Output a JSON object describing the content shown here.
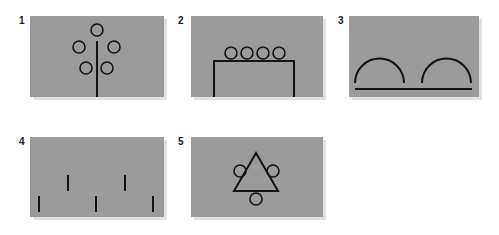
{
  "figure": {
    "background_color": "#ffffff",
    "panel_color": "#9b9b9b",
    "line_color": "#141414",
    "panels": [
      {
        "id": 1,
        "label": "1",
        "description": "Vertical stem with five circles arranged around its top (tree-like pattern)"
      },
      {
        "id": 2,
        "label": "2",
        "description": "Four circles in a row resting on top of a rectangular bracket/table shape"
      },
      {
        "id": 3,
        "label": "3",
        "description": "Two semicircular arcs sitting above a horizontal baseline"
      },
      {
        "id": 4,
        "label": "4",
        "description": "Five short vertical tick marks in two staggered rows"
      },
      {
        "id": 5,
        "label": "5",
        "description": "Triangle with three circles touching its left side, right side and base"
      }
    ]
  }
}
